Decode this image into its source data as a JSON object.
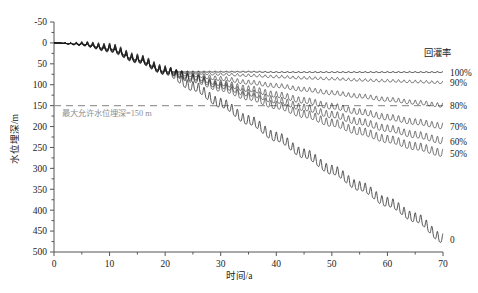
{
  "chart_data": {
    "type": "line",
    "title": "",
    "xlabel": "时间/a",
    "ylabel": "水位埋深/m",
    "xlim": [
      0,
      70
    ],
    "ylim": [
      -50,
      500
    ],
    "y_inverted": true,
    "grid": false,
    "xticks": [
      0,
      10,
      20,
      30,
      40,
      50,
      60,
      70
    ],
    "xticklabels": [
      "0",
      "10",
      "20",
      "30",
      "40",
      "50",
      "60",
      "70"
    ],
    "yticks": [
      -50,
      0,
      50,
      100,
      150,
      200,
      250,
      300,
      350,
      400,
      450,
      500
    ],
    "yticklabels": [
      "-50",
      "0",
      "50",
      "100",
      "150",
      "200",
      "250",
      "300",
      "350",
      "400",
      "450",
      "500"
    ],
    "legend_title": "回灌率",
    "legend_position": "right",
    "annotations": [
      {
        "name": "max-allowable-depth",
        "text": "最大允许水位埋深=150 m",
        "y_value": 150,
        "x_value": 2,
        "line_style": "dashed",
        "color": "#9a9a9a"
      }
    ],
    "oscillation": {
      "period_years": 1,
      "amplitude_m": 9,
      "description": "annual seasonal fluctuation superimposed on trend"
    },
    "common_segment_note": "All series coincide from year 0 to year 20, declining from 0 m to about 70 m depth.",
    "series": [
      {
        "name": "100%",
        "label": "100%",
        "x": [
          0,
          5,
          10,
          15,
          20,
          25,
          30,
          35,
          40,
          45,
          50,
          55,
          60,
          65,
          70
        ],
        "values": [
          0,
          3,
          14,
          40,
          68,
          69,
          69,
          69,
          70,
          70,
          70,
          70,
          70,
          70,
          70
        ],
        "end_value": 70,
        "amplitude_m": 1
      },
      {
        "name": "90%",
        "label": "90%",
        "x": [
          0,
          5,
          10,
          15,
          20,
          25,
          30,
          35,
          40,
          45,
          50,
          55,
          60,
          65,
          70
        ],
        "values": [
          0,
          3,
          14,
          40,
          68,
          72,
          75,
          78,
          81,
          84,
          86,
          89,
          91,
          93,
          95
        ],
        "end_value": 95,
        "amplitude_m": 3
      },
      {
        "name": "80%",
        "label": "80%",
        "x": [
          0,
          5,
          10,
          15,
          20,
          25,
          30,
          35,
          40,
          45,
          50,
          55,
          60,
          65,
          70
        ],
        "values": [
          0,
          3,
          14,
          40,
          68,
          77,
          86,
          95,
          103,
          112,
          120,
          128,
          136,
          143,
          150
        ],
        "end_value": 150,
        "amplitude_m": 5
      },
      {
        "name": "70%",
        "label": "70%",
        "x": [
          0,
          5,
          10,
          15,
          20,
          25,
          30,
          35,
          40,
          45,
          50,
          55,
          60,
          65,
          70
        ],
        "values": [
          0,
          3,
          14,
          40,
          68,
          82,
          97,
          111,
          125,
          139,
          153,
          166,
          179,
          190,
          200
        ],
        "end_value": 200,
        "amplitude_m": 7
      },
      {
        "name": "60%",
        "label": "60%",
        "x": [
          0,
          5,
          10,
          15,
          20,
          25,
          30,
          35,
          40,
          45,
          50,
          55,
          60,
          65,
          70
        ],
        "values": [
          0,
          3,
          14,
          40,
          68,
          85,
          103,
          121,
          138,
          156,
          173,
          190,
          206,
          221,
          235
        ],
        "end_value": 235,
        "amplitude_m": 8
      },
      {
        "name": "50%",
        "label": "50%",
        "x": [
          0,
          5,
          10,
          15,
          20,
          25,
          30,
          35,
          40,
          45,
          50,
          55,
          60,
          65,
          70
        ],
        "values": [
          0,
          3,
          14,
          40,
          68,
          88,
          109,
          130,
          151,
          172,
          193,
          213,
          232,
          249,
          265
        ],
        "end_value": 265,
        "amplitude_m": 9
      },
      {
        "name": "0",
        "label": "0",
        "x": [
          0,
          5,
          10,
          15,
          20,
          25,
          30,
          35,
          40,
          45,
          50,
          55,
          60,
          65,
          70
        ],
        "values": [
          0,
          3,
          14,
          40,
          68,
          106,
          146,
          187,
          227,
          267,
          306,
          345,
          383,
          420,
          470
        ],
        "end_value": 470,
        "amplitude_m": 11
      }
    ]
  }
}
